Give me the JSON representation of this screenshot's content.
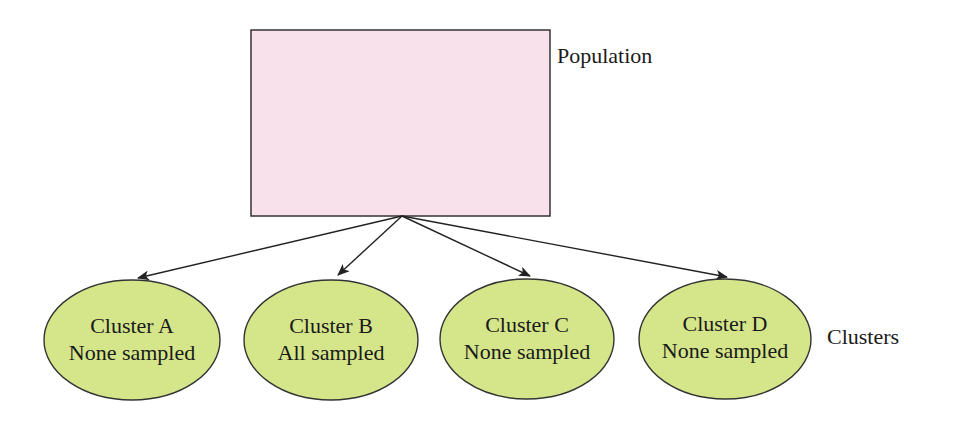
{
  "diagram": {
    "population": {
      "label": "Population",
      "fill": "#f9e1ec",
      "stroke": "#333333"
    },
    "clusters_label": "Clusters",
    "cluster_fill": "#d5e68a",
    "cluster_stroke": "#333333",
    "clusters": [
      {
        "name": "Cluster A",
        "status": "None sampled"
      },
      {
        "name": "Cluster B",
        "status": "All sampled"
      },
      {
        "name": "Cluster C",
        "status": "None sampled"
      },
      {
        "name": "Cluster D",
        "status": "None sampled"
      }
    ],
    "edges": [
      {
        "from": "Population",
        "to": "Cluster A"
      },
      {
        "from": "Population",
        "to": "Cluster B"
      },
      {
        "from": "Population",
        "to": "Cluster C"
      },
      {
        "from": "Population",
        "to": "Cluster D"
      }
    ]
  }
}
